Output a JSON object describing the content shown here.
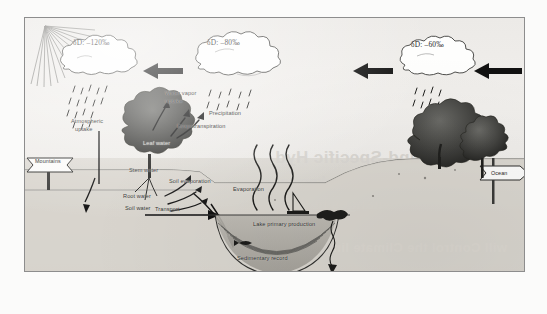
{
  "figure": {
    "frame": {
      "border_color": "#8d8d8d",
      "paper_color": "#f2f1ef"
    }
  },
  "clouds": [
    {
      "id": "cloud-left",
      "delta_label": "δD: –120‰",
      "delta_value": -120,
      "unit": "‰"
    },
    {
      "id": "cloud-middle",
      "delta_label": "δD: –80‰",
      "delta_value": -80,
      "unit": "‰"
    },
    {
      "id": "cloud-right",
      "delta_label": "δD: –60‰",
      "delta_value": -60,
      "unit": "‰"
    }
  ],
  "signposts": [
    {
      "id": "mountains-sign",
      "label": "Mountains",
      "direction": "left"
    },
    {
      "id": "ocean-sign",
      "label": "Ocean",
      "direction": "right"
    }
  ],
  "process_labels": [
    {
      "id": "atmospheric-uptake",
      "text": "Atmospheric\nuptake"
    },
    {
      "id": "water-vapor-uptake",
      "text": "Water vapor\nuptake"
    },
    {
      "id": "evapotranspiration",
      "text": "Evapotranspiration"
    },
    {
      "id": "precipitation",
      "text": "Precipitation"
    },
    {
      "id": "leaf-water",
      "text": "Leaf water"
    },
    {
      "id": "stem-water",
      "text": "Stem water"
    },
    {
      "id": "soil-evaporation",
      "text": "Soil evaporation"
    },
    {
      "id": "root-water",
      "text": "Root water"
    },
    {
      "id": "soil-water",
      "text": "Soil water"
    },
    {
      "id": "transport",
      "text": "Transport"
    },
    {
      "id": "evaporation",
      "text": "Evaporation"
    },
    {
      "id": "lake-primary-production",
      "text": "Lake primary production"
    },
    {
      "id": "sedimentary-record",
      "text": "Sedimentary record"
    }
  ],
  "labels": {
    "atmospheric_uptake_l1": "Atmospheric",
    "atmospheric_uptake_l2": "uptake",
    "water_vapor_uptake_l1": "Water vapor",
    "water_vapor_uptake_l2": "uptake",
    "evapotranspiration": "Evapotranspiration",
    "precipitation": "Precipitation",
    "leaf_water": "Leaf water",
    "stem_water": "Stem water",
    "soil_evaporation": "Soil evaporation",
    "root_water": "Root water",
    "soil_water": "Soil water",
    "transport": "Transport",
    "evaporation": "Evaporation",
    "lake_primary_production": "Lake primary production",
    "sedimentary_record": "Sedimentary record",
    "mountains": "Mountains",
    "ocean": "Ocean"
  },
  "bleed_through": {
    "line1": "Compound-Specific Hyd",
    "line2": "ies of Biomarkers a",
    "line3": "hanges in the",
    "line4": "will Control the Climate limi"
  },
  "scene": {
    "sun": {
      "id": "sun-rays",
      "position": "top-left",
      "ray_count": 13
    },
    "arrows": [
      {
        "id": "transport-arrow-1",
        "from": "cloud-right",
        "to": "cloud-middle",
        "direction": "left"
      },
      {
        "id": "transport-arrow-2",
        "from": "cloud-middle",
        "to": "cloud-left",
        "direction": "left"
      },
      {
        "id": "transport-arrow-3",
        "from": "ocean",
        "to": "cloud-right",
        "direction": "left"
      }
    ],
    "vegetation": [
      {
        "id": "shrub-left",
        "type": "broadleaf-shrub"
      },
      {
        "id": "tree-right-broad",
        "type": "broadleaf-tree"
      },
      {
        "id": "tree-right-conifer",
        "type": "conifer-tree"
      }
    ],
    "lake": {
      "id": "lake-basin",
      "has_sediment_layers": true,
      "sediment_layer_count": 7
    }
  }
}
